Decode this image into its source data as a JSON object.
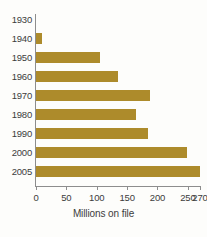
{
  "chart_data": {
    "type": "bar",
    "orientation": "horizontal",
    "title": "",
    "xlabel": "Millions on file",
    "ylabel": "",
    "categories": [
      "1930",
      "1940",
      "1950",
      "1960",
      "1970",
      "1980",
      "1990",
      "2000",
      "2005"
    ],
    "values": [
      0,
      10,
      105,
      135,
      188,
      165,
      185,
      248,
      270
    ],
    "xlim": [
      0,
      270
    ],
    "xticks": [
      0,
      50,
      100,
      150,
      200,
      250,
      270
    ],
    "xtick_labels": [
      "0",
      "50",
      "100",
      "150",
      "200",
      "250",
      "270"
    ],
    "grid": false,
    "legend": false,
    "bar_color": "#ad8b2b",
    "axis_color": "#8d8d8d",
    "text_color": "#3c3c3c",
    "background_color": "#fdfdfb"
  }
}
